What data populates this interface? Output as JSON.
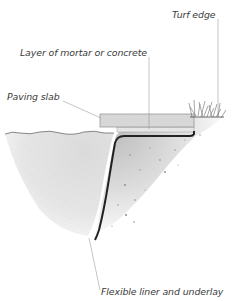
{
  "diagram": {
    "labels": {
      "turf_edge": "Turf edge",
      "mortar_layer": "Layer of mortar or concrete",
      "paving_slab": "Paving slab",
      "liner": "Flexible liner and underlay"
    },
    "components": [
      {
        "id": "turf",
        "name": "Turf edge"
      },
      {
        "id": "mortar",
        "name": "Layer of mortar or concrete"
      },
      {
        "id": "slab",
        "name": "Paving slab"
      },
      {
        "id": "liner",
        "name": "Flexible liner and underlay"
      },
      {
        "id": "water",
        "name": "Pond water"
      },
      {
        "id": "soil",
        "name": "Soil"
      }
    ],
    "colors": {
      "text": "#3a3a3a",
      "leader": "#8a8a8a",
      "liner": "#222222",
      "slab": "#d6d6d6",
      "water": "#e4e4e4",
      "soil": "#c8c8c8"
    }
  }
}
